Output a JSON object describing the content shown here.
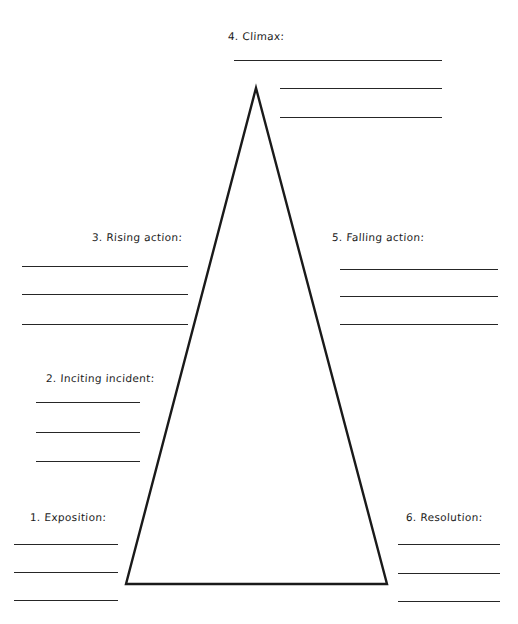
{
  "worksheet": {
    "title": "Plot Diagram Worksheet",
    "background_color": "#ffffff",
    "ink_color": "#262626"
  },
  "diagram": {
    "shape": "triangle",
    "name": "freytag-pyramid",
    "apex": {
      "x": 256,
      "y": 88
    },
    "base_left": {
      "x": 126,
      "y": 584
    },
    "base_right": {
      "x": 387,
      "y": 584
    },
    "stroke_color": "#1a1a1a",
    "stroke_width": 2.4
  },
  "sections": [
    {
      "id": "exposition",
      "label": "1. Exposition:",
      "label_x": 30,
      "label_y": 511,
      "lines": [
        {
          "x": 14,
          "y": 544,
          "width": 104
        },
        {
          "x": 14,
          "y": 572,
          "width": 104
        },
        {
          "x": 14,
          "y": 600,
          "width": 104
        }
      ]
    },
    {
      "id": "inciting-incident",
      "label": "2. Inciting incident:",
      "label_x": 46,
      "label_y": 372,
      "lines": [
        {
          "x": 36,
          "y": 402,
          "width": 104
        },
        {
          "x": 36,
          "y": 432,
          "width": 104
        },
        {
          "x": 36,
          "y": 461,
          "width": 104
        }
      ]
    },
    {
      "id": "rising-action",
      "label": "3. Rising action:",
      "label_x": 92,
      "label_y": 231,
      "lines": [
        {
          "x": 22,
          "y": 266,
          "width": 166
        },
        {
          "x": 22,
          "y": 294,
          "width": 166
        },
        {
          "x": 22,
          "y": 324,
          "width": 166
        }
      ]
    },
    {
      "id": "climax",
      "label": "4. Climax:",
      "label_x": 228,
      "label_y": 30,
      "lines": [
        {
          "x": 234,
          "y": 60,
          "width": 208
        },
        {
          "x": 280,
          "y": 88,
          "width": 162
        },
        {
          "x": 280,
          "y": 117,
          "width": 162
        }
      ]
    },
    {
      "id": "falling-action",
      "label": "5. Falling action:",
      "label_x": 332,
      "label_y": 231,
      "lines": [
        {
          "x": 340,
          "y": 269,
          "width": 158
        },
        {
          "x": 340,
          "y": 296,
          "width": 158
        },
        {
          "x": 340,
          "y": 324,
          "width": 158
        }
      ]
    },
    {
      "id": "resolution",
      "label": "6. Resolution:",
      "label_x": 406,
      "label_y": 511,
      "lines": [
        {
          "x": 398,
          "y": 544,
          "width": 102
        },
        {
          "x": 398,
          "y": 573,
          "width": 102
        },
        {
          "x": 398,
          "y": 601,
          "width": 102
        }
      ]
    }
  ]
}
